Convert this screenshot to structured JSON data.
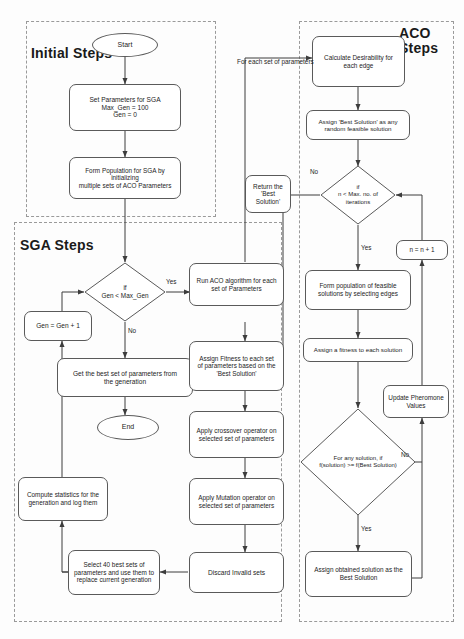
{
  "diagram": {
    "regions": [
      {
        "id": "initial",
        "label_lines": [
          "Initial Steps"
        ]
      },
      {
        "id": "sga",
        "label_lines": [
          "SGA",
          "Steps"
        ]
      },
      {
        "id": "aco",
        "label_lines": [
          "ACO",
          "Steps"
        ]
      }
    ],
    "nodes": {
      "start": {
        "lines": [
          "Start"
        ],
        "shape": "terminator"
      },
      "set_params": {
        "lines": [
          "Set Parameters for SGA",
          "Max_Gen = 100",
          "Gen = 0"
        ],
        "shape": "process"
      },
      "form_population": {
        "lines": [
          "Form Population for SGA by initializing",
          "multiple sets of ACO Parameters"
        ],
        "shape": "process"
      },
      "gen_check": {
        "lines": [
          "if",
          "Gen < Max_Gen"
        ],
        "shape": "decision"
      },
      "gen_increment": {
        "lines": [
          "Gen = Gen + 1"
        ],
        "shape": "process"
      },
      "get_best_params": {
        "lines": [
          "Get the best set of parameters from",
          "the generation"
        ],
        "shape": "process"
      },
      "end": {
        "lines": [
          "End"
        ],
        "shape": "terminator"
      },
      "compute_stats": {
        "lines": [
          "Compute statistics for the",
          "generation and log them"
        ],
        "shape": "process"
      },
      "select_best": {
        "lines": [
          "Select 40 best sets of",
          "parameters and use them to",
          "replace current generation"
        ],
        "shape": "process"
      },
      "run_aco": {
        "lines": [
          "Run ACO algorithm for each",
          "set of Parameters"
        ],
        "shape": "process"
      },
      "assign_fitness_params": {
        "lines": [
          "Assign Fitness to each set",
          "of parameters based on the",
          "'Best Solution'"
        ],
        "shape": "process"
      },
      "crossover": {
        "lines": [
          "Apply crossover operator on",
          "selected set of parameters"
        ],
        "shape": "process"
      },
      "mutation": {
        "lines": [
          "Apply Mutation operator on",
          "selected set of parameters"
        ],
        "shape": "process"
      },
      "discard_invalid": {
        "lines": [
          "Discard Invalid sets"
        ],
        "shape": "process"
      },
      "return_best": {
        "lines": [
          "Return the",
          "'Best Solution'"
        ],
        "shape": "process"
      },
      "calc_desirability": {
        "lines": [
          "Calculate Desirability for",
          "each edge"
        ],
        "shape": "process"
      },
      "assign_best_random": {
        "lines": [
          "Assign 'Best Solution' as any",
          "random feasible solution"
        ],
        "shape": "process"
      },
      "iter_check": {
        "lines": [
          "if",
          "n < Max. no. of",
          "iterations"
        ],
        "shape": "decision"
      },
      "n_increment": {
        "lines": [
          "n = n + 1"
        ],
        "shape": "process"
      },
      "form_feasible": {
        "lines": [
          "Form population of feasible",
          "solutions by selecting edges"
        ],
        "shape": "process"
      },
      "assign_fitness_sol": {
        "lines": [
          "Assign a fitness to each solution"
        ],
        "shape": "process"
      },
      "update_pheromone": {
        "lines": [
          "Update Pheromone",
          "Values"
        ],
        "shape": "process"
      },
      "solution_check": {
        "lines": [
          "For any solution, if",
          "f(solution) >= f(Best Solution)"
        ],
        "shape": "decision"
      },
      "assign_obtained": {
        "lines": [
          "Assign obtained solution as the",
          "Best Solution"
        ],
        "shape": "process"
      }
    },
    "edge_labels": {
      "gen_yes": "Yes",
      "gen_no": "No",
      "for_each_set": [
        "For each set of",
        "parameters"
      ],
      "iter_no": "No",
      "iter_yes": "Yes",
      "sol_no": "No",
      "sol_yes": "Yes"
    },
    "colors": {
      "stroke": "#5a5a5a",
      "wire": "#3c3c3c",
      "region_border": "#9a9a9a",
      "text": "#1d1d1d",
      "background": "#fdfdfd"
    }
  }
}
